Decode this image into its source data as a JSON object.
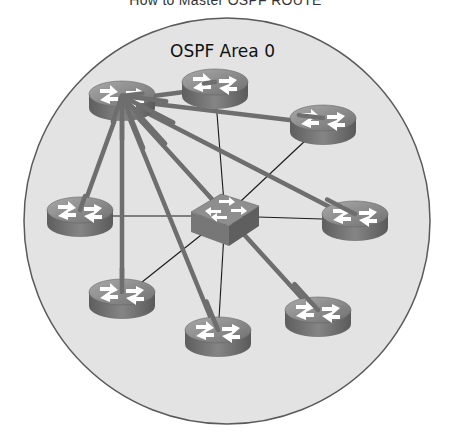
{
  "page": {
    "title": "How to Master OSPF ROUTE"
  },
  "diagram": {
    "area_label": "OSPF Area 0",
    "colors": {
      "area_fill": "#e3e3e3",
      "area_border": "#5a5a5a",
      "adjacency_line": "#6e6e6e",
      "link_line": "#1a1a1a",
      "device_top": "#8a8a8a",
      "device_side": "#6a6a6a",
      "arrow": "#ffffff"
    },
    "area": {
      "cx": 227,
      "cy": 221,
      "r": 203
    },
    "hub": "R1",
    "routers": [
      {
        "id": "R1",
        "x": 122,
        "y": 100,
        "role": "DR"
      },
      {
        "id": "R2",
        "x": 215,
        "y": 88
      },
      {
        "id": "R3",
        "x": 323,
        "y": 124
      },
      {
        "id": "R4",
        "x": 80,
        "y": 216
      },
      {
        "id": "R5",
        "x": 355,
        "y": 220
      },
      {
        "id": "R6",
        "x": 122,
        "y": 298
      },
      {
        "id": "R7",
        "x": 218,
        "y": 336
      },
      {
        "id": "R8",
        "x": 318,
        "y": 316
      }
    ],
    "switch": {
      "id": "SW1",
      "x": 225,
      "y": 216
    },
    "adjacencies": [
      [
        "R1",
        "R2"
      ],
      [
        "R1",
        "R3"
      ],
      [
        "R1",
        "R4"
      ],
      [
        "R1",
        "R5"
      ],
      [
        "R1",
        "R6"
      ],
      [
        "R1",
        "R7"
      ],
      [
        "R1",
        "R8"
      ]
    ],
    "links": [
      [
        "SW1",
        "R1"
      ],
      [
        "SW1",
        "R2"
      ],
      [
        "SW1",
        "R3"
      ],
      [
        "SW1",
        "R4"
      ],
      [
        "SW1",
        "R5"
      ],
      [
        "SW1",
        "R6"
      ],
      [
        "SW1",
        "R7"
      ],
      [
        "SW1",
        "R8"
      ]
    ]
  }
}
